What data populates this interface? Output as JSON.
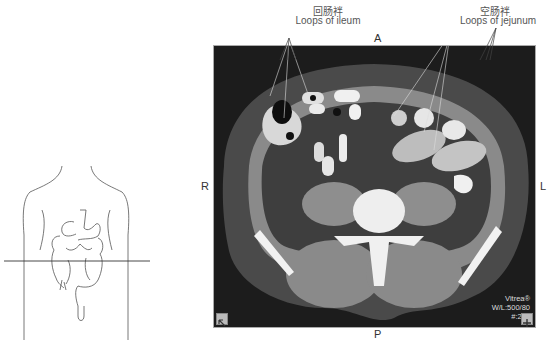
{
  "annotations": {
    "ileum": {
      "label_zh": "回肠袢",
      "label_en": "Loops of ileum"
    },
    "jejunum": {
      "label_zh": "空肠袢",
      "label_en": "Loops of jejunum"
    }
  },
  "orientation": {
    "anterior": "A",
    "posterior": "P",
    "right": "R",
    "left": "L"
  },
  "ct_overlay": {
    "vendor": "Vitrea®",
    "window_level": "W/L:500/80",
    "slice": "#:255"
  },
  "icons": {
    "bottom_left": "cursor-arrow-icon",
    "bottom_right": "plus-icon"
  },
  "colors": {
    "ct_background": "#1c1c1c",
    "fat": "#3a3a3a",
    "soft_tissue": "#8a8a8a",
    "bone": "#f2f2f2"
  }
}
